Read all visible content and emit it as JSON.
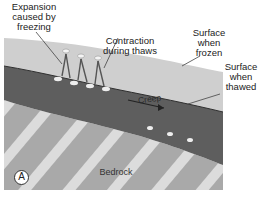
{
  "diagram": {
    "labels": {
      "expansion": "Expansion\ncaused by\nfreezing",
      "contraction": "Contraction\nduring thaws",
      "surface_frozen": "Surface\nwhen\nfrozen",
      "surface_thawed": "Surface\nwhen\nthawed",
      "creep": "Creep",
      "bedrock": "Bedrock",
      "panel_badge": "A"
    },
    "colors": {
      "frozen_layer": "#cfcfcf",
      "soil_layer": "#5e5e5e",
      "bedrock": "#a9a9a9",
      "bedrock_stripes": "#dcdcdc",
      "arrows": "#555555"
    }
  }
}
